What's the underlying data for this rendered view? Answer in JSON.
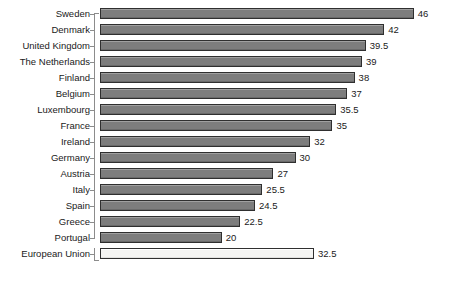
{
  "chart_data": {
    "type": "bar",
    "orientation": "horizontal",
    "title": "",
    "subtitle": "",
    "xlabel": "",
    "ylabel": "",
    "grid": false,
    "legend": null,
    "axis": {
      "value_axis_visible": false,
      "category_axis_visible": true,
      "tick_labels_shown": false,
      "bar_start_value": 3.5,
      "bar_end_max_value": 46
    },
    "categories": [
      "Sweden",
      "Denmark",
      "United Kingdom",
      "The Netherlands",
      "Finland",
      "Belgium",
      "Luxembourg",
      "France",
      "Ireland",
      "Germany",
      "Austria",
      "Italy",
      "Spain",
      "Greece",
      "Portugal",
      "European Union"
    ],
    "values": [
      46,
      42,
      39.5,
      39,
      38,
      37,
      35.5,
      35,
      32,
      30,
      27,
      25.5,
      24.5,
      22.5,
      20,
      32.5
    ],
    "value_labels": [
      "46",
      "42",
      "39.5",
      "39",
      "38",
      "37",
      "35.5",
      "35",
      "32",
      "30",
      "27",
      "25.5",
      "24.5",
      "22.5",
      "20",
      "32.5"
    ],
    "highlighted_category": "European Union",
    "colors": {
      "bar_fill": "#7d7d7d",
      "bar_border": "#2f2f2f",
      "highlight_fill": "#f4f4f2",
      "highlight_border": "#2f2f2f",
      "axis": "#8c8c8c",
      "text": "#1a1a1a",
      "background": "#ffffff"
    }
  }
}
